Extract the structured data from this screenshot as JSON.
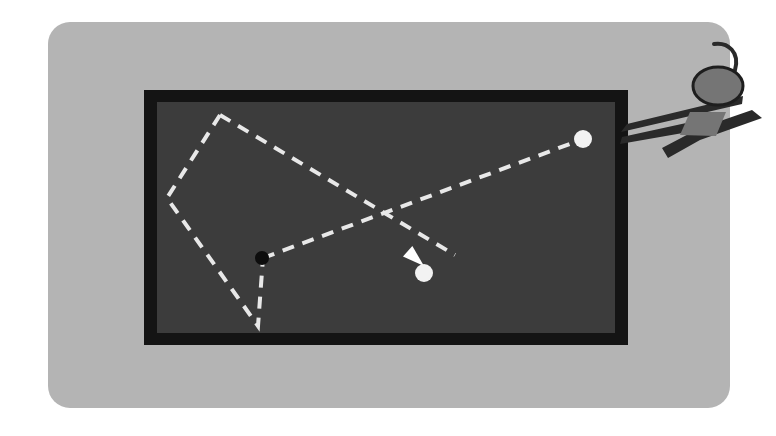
{
  "figure": {
    "title": "Person viewing a dark display with dashed gaze/motion trajectories",
    "background_color": "#ffffff",
    "panel": {
      "name": "outer-panel",
      "fill": "#b4b4b4",
      "x": 48,
      "y": 22,
      "width": 682,
      "height": 386,
      "corner_radius": 22
    },
    "frame": {
      "name": "display-bezel",
      "fill": "#141414",
      "x": 144,
      "y": 90,
      "width": 484,
      "height": 255
    },
    "screen": {
      "name": "display-screen",
      "fill": "#3c3c3c",
      "x": 157,
      "y": 102,
      "width": 458,
      "height": 231
    },
    "dash_color": "#e8e8e8",
    "dash_pattern": "12 9",
    "dash_width": 4,
    "paths": [
      {
        "name": "trajectory-polygon",
        "points": "220,115 167,198 258,326 263,258"
      },
      {
        "name": "trajectory-polygon-closing-edge",
        "points": "220,115 455,255"
      },
      {
        "name": "trajectory-long-diagonal",
        "points": "263,258 583,139"
      }
    ],
    "arrow": {
      "name": "direction-arrow",
      "tip_x": 424,
      "tip_y": 266,
      "angle_deg": 42,
      "fill": "#ffffff",
      "length": 22,
      "half_width": 7
    },
    "markers": [
      {
        "name": "origin-dot-black",
        "cx": 262,
        "cy": 258,
        "r": 7,
        "fill": "#0d0d0d",
        "label": "start point"
      },
      {
        "name": "target-dot-white-center",
        "cx": 424,
        "cy": 273,
        "r": 9,
        "fill": "#f2f2f2",
        "label": "target point"
      },
      {
        "name": "target-dot-white-edge",
        "cx": 583,
        "cy": 139,
        "r": 9,
        "fill": "#f2f2f2",
        "label": "endpoint near viewer"
      }
    ],
    "person": {
      "name": "person-figure",
      "body_fill": "#2a2a2a",
      "head_fill": "#757575",
      "head_stroke": "#1e1e1e",
      "head": {
        "cx": 718,
        "cy": 86,
        "rx": 25,
        "ry": 19
      },
      "hair_curl": "M 735,70 C 740,52 728,42 714,44",
      "arm_upper": "M 743,96 L 627,124 L 621,132 L 742,104 Z",
      "arm_lower": "M 700,120 L 622,137 L 620,144 L 700,130 Z",
      "torso": "M 690,112 L 726,112 L 716,136 L 680,135 Z",
      "leg": "M 762,118 L 700,140 L 668,158 L 662,148 L 700,128 L 752,110 Z"
    }
  }
}
